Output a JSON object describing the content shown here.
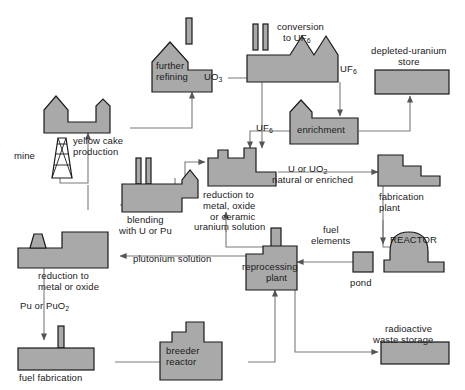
{
  "diagram": {
    "colors": {
      "building_fill": "#a9a9a9",
      "building_stroke": "#1a1a1a",
      "arrow": "#6e6e6e",
      "text": "#1a1a1a",
      "background": "#ffffff"
    }
  },
  "nodes": {
    "mine": {
      "label": "mine"
    },
    "yellow_cake": {
      "label_line1": "yellow cake",
      "label_line2": "production"
    },
    "further_refining": {
      "label_line1": "further",
      "label_line2": "refining"
    },
    "conversion": {
      "label_line1": "conversion",
      "label_line2": "to UF",
      "label_sub": "6"
    },
    "depleted_store": {
      "label_line1": "depleted-uranium",
      "label_line2": "store"
    },
    "enrichment": {
      "label": "enrichment"
    },
    "reduction_metal_oxide_ceramic": {
      "label_line1": "reduction to",
      "label_line2": "metal, oxide",
      "label_line3": "or ceramic"
    },
    "fabrication_plant": {
      "label_line1": "fabrication",
      "label_line2": "plant"
    },
    "blending": {
      "label_line1": "blending",
      "label_line2": "with U or Pu"
    },
    "reduction_metal_oxide": {
      "label_line1": "reduction to",
      "label_line2": "metal or oxide"
    },
    "fuel_fabrication": {
      "label": "fuel fabrication"
    },
    "breeder_reactor": {
      "label_line1": "breeder",
      "label_line2": "reactor"
    },
    "reprocessing_plant": {
      "label_line1": "reprocessing",
      "label_line2": "plant"
    },
    "reactor": {
      "label": "REACTOR"
    },
    "pond": {
      "label": "pond"
    },
    "radioactive_waste": {
      "label_line1": "radioactive",
      "label_line2": "waste storage"
    }
  },
  "flow_labels": {
    "uo3": {
      "text": "UO",
      "sub": "3"
    },
    "uf6_top": {
      "text": "UF",
      "sub": "6"
    },
    "uf6_mid": {
      "text": "UF",
      "sub": "6"
    },
    "u_or_uo2": {
      "line1": "U or UO",
      "line1_sub": "2",
      "line2": "natural or enriched"
    },
    "fuel_elements": {
      "line1": "fuel",
      "line2": "elements"
    },
    "uranium_solution": {
      "text": "uranium solution"
    },
    "plutonium_solution": {
      "text": "plutonium solution"
    },
    "pu_or_puo2": {
      "text": "Pu or PuO",
      "sub": "2"
    }
  }
}
